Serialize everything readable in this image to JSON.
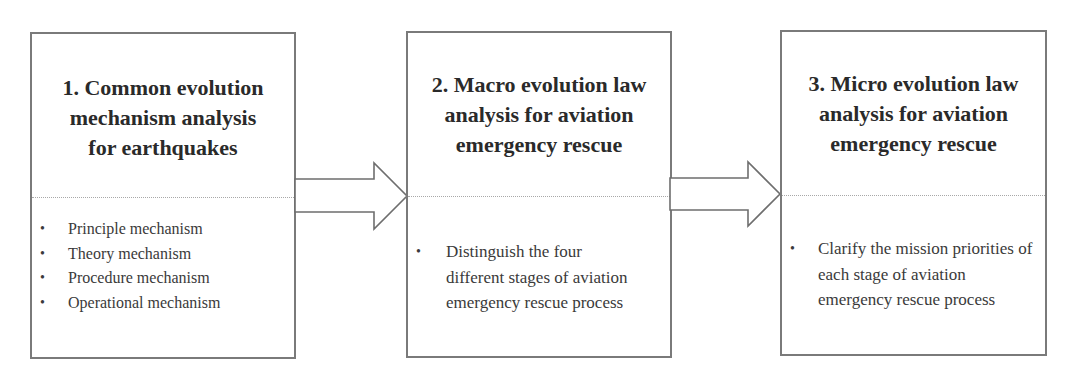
{
  "diagram": {
    "type": "process-flow",
    "direction": "left-to-right",
    "colors": {
      "border": "#7a7a7a",
      "divider": "#a8a8a8",
      "title_text": "#2a2a2a",
      "body_text": "#3a3a3a",
      "arrow_stroke": "#6e6e6e",
      "background": "#ffffff"
    },
    "bullet_glyph": "•",
    "boxes": [
      {
        "id": "step-1",
        "title_lines": [
          "1. Common evolution",
          "mechanism analysis",
          "for earthquakes"
        ],
        "title": "1. Common evolution mechanism analysis for earthquakes",
        "bullets": [
          "Principle mechanism",
          "Theory mechanism",
          "Procedure mechanism",
          "Operational mechanism"
        ]
      },
      {
        "id": "step-2",
        "title_lines": [
          "2. Macro evolution law",
          "analysis for aviation",
          "emergency rescue"
        ],
        "title": "2. Macro evolution law analysis for aviation emergency rescue",
        "bullets": [
          "Distinguish the four different stages of aviation emergency rescue process"
        ]
      },
      {
        "id": "step-3",
        "title_lines": [
          "3. Micro evolution law",
          "analysis for aviation",
          "emergency rescue"
        ],
        "title": "3. Micro evolution law analysis for aviation emergency rescue",
        "bullets": [
          "Clarify the mission priorities of each stage of aviation emergency rescue process"
        ]
      }
    ],
    "connectors": [
      {
        "from": "step-1",
        "to": "step-2",
        "icon": "block-arrow-right"
      },
      {
        "from": "step-2",
        "to": "step-3",
        "icon": "block-arrow-right"
      }
    ]
  }
}
